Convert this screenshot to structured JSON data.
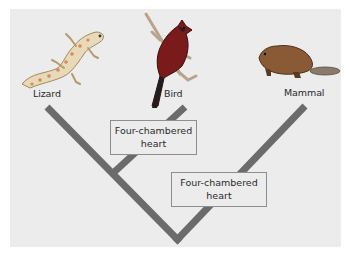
{
  "diagram": {
    "type": "cladogram",
    "taxa": [
      {
        "id": "lizard",
        "label": "Lizard",
        "icon": "lizard-icon"
      },
      {
        "id": "bird",
        "label": "Bird",
        "icon": "bird-icon"
      },
      {
        "id": "mammal",
        "label": "Mammal",
        "icon": "mammal-icon"
      }
    ],
    "traits": [
      {
        "line1": "Four-chambered",
        "line2": "heart",
        "branch": "bird"
      },
      {
        "line1": "Four-chambered",
        "line2": "heart",
        "branch": "mammal"
      }
    ],
    "colors": {
      "background": "#ececec",
      "branch": "#6b6b6b",
      "box_border": "#8e8e8e",
      "text": "#2a2a2a"
    }
  }
}
